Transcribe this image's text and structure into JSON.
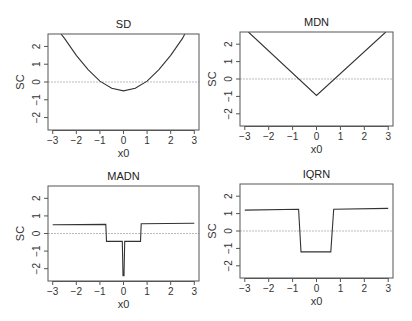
{
  "chart_data": [
    {
      "type": "line",
      "title": "SD",
      "xlabel": "x0",
      "ylabel": "SC",
      "xlim": [
        -3.2,
        3.2
      ],
      "ylim": [
        -2.7,
        2.7
      ],
      "x_ticks": [
        -3,
        -2,
        -1,
        0,
        1,
        2,
        3
      ],
      "y_ticks": [
        -2,
        -1,
        0,
        1,
        2
      ],
      "reference_line_y": 0,
      "grid": false,
      "series": [
        {
          "name": "SD",
          "x": [
            -2.65,
            -2.5,
            -2.0,
            -1.5,
            -1.0,
            -0.5,
            0.0,
            0.5,
            1.0,
            1.5,
            2.0,
            2.5,
            2.6
          ],
          "y": [
            2.7,
            2.45,
            1.5,
            0.7,
            0.05,
            -0.35,
            -0.5,
            -0.35,
            0.05,
            0.7,
            1.5,
            2.45,
            2.7
          ]
        }
      ]
    },
    {
      "type": "line",
      "title": "MDN",
      "xlabel": "x0",
      "ylabel": "SC",
      "xlim": [
        -3.2,
        3.2
      ],
      "ylim": [
        -2.7,
        2.7
      ],
      "x_ticks": [
        -3,
        -2,
        -1,
        0,
        1,
        2,
        3
      ],
      "y_ticks": [
        -2,
        -1,
        0,
        1,
        2
      ],
      "reference_line_y": 0,
      "grid": false,
      "series": [
        {
          "name": "MDN",
          "x": [
            -2.85,
            0.0,
            2.9
          ],
          "y": [
            2.7,
            -0.95,
            2.7
          ]
        }
      ]
    },
    {
      "type": "line",
      "title": "MADN",
      "xlabel": "x0",
      "ylabel": "SC",
      "xlim": [
        -3.2,
        3.2
      ],
      "ylim": [
        -2.7,
        2.7
      ],
      "x_ticks": [
        -3,
        -2,
        -1,
        0,
        1,
        2,
        3
      ],
      "y_ticks": [
        -2,
        -1,
        0,
        1,
        2
      ],
      "reference_line_y": 0,
      "grid": false,
      "series": [
        {
          "name": "MADN",
          "x": [
            -3.0,
            -0.75,
            -0.72,
            -0.05,
            -0.02,
            0.02,
            0.05,
            0.72,
            0.75,
            3.0
          ],
          "y": [
            0.5,
            0.52,
            -0.45,
            -0.45,
            -2.4,
            -2.4,
            -0.45,
            -0.45,
            0.55,
            0.58
          ]
        }
      ]
    },
    {
      "type": "line",
      "title": "IQRN",
      "xlabel": "x0",
      "ylabel": "SC",
      "xlim": [
        -3.2,
        3.2
      ],
      "ylim": [
        -2.7,
        2.7
      ],
      "x_ticks": [
        -3,
        -2,
        -1,
        0,
        1,
        2,
        3
      ],
      "y_ticks": [
        -2,
        -1,
        0,
        1,
        2
      ],
      "reference_line_y": 0,
      "grid": false,
      "series": [
        {
          "name": "IQRN",
          "x": [
            -3.0,
            -0.75,
            -0.65,
            0.6,
            0.72,
            3.0
          ],
          "y": [
            1.2,
            1.25,
            -1.2,
            -1.2,
            1.25,
            1.3
          ]
        }
      ]
    }
  ]
}
